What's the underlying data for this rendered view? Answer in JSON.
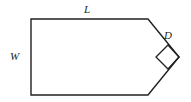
{
  "figure": {
    "background_color": "#ffffff",
    "stroke_color": "#231f20",
    "stroke_width": 1.4,
    "fill_color": "none",
    "labels": {
      "length": "L",
      "width": "W",
      "diagonal": "D"
    },
    "label_positions": {
      "length": "top edge, centered above",
      "width": "left edge, centered to the left",
      "diagonal": "upper-right slanted edge, above and right"
    },
    "geometry": {
      "vertices": [
        {
          "name": "top-left",
          "x": 31,
          "y": 19
        },
        {
          "name": "top-right",
          "x": 148,
          "y": 19
        },
        {
          "name": "apex",
          "x": 179,
          "y": 57
        },
        {
          "name": "bottom-right",
          "x": 148,
          "y": 95
        },
        {
          "name": "bottom-left",
          "x": 31,
          "y": 95
        }
      ],
      "right_angle_marker": {
        "at_vertex": "apex",
        "shape": "square",
        "points": [
          {
            "x": 179,
            "y": 57
          },
          {
            "x": 168,
            "y": 45
          },
          {
            "x": 156,
            "y": 57
          },
          {
            "x": 168,
            "y": 69
          }
        ]
      }
    }
  }
}
